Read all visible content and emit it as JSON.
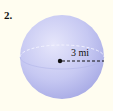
{
  "problem": {
    "number": "2."
  },
  "figure": {
    "shape": "sphere",
    "radius_label": "3 mi",
    "colors": {
      "background": "#fffdf0",
      "sphere_light": "#e4e4fa",
      "sphere_mid": "#bfc1f0",
      "sphere_dark": "#a3a6e4",
      "line": "#111111"
    }
  }
}
